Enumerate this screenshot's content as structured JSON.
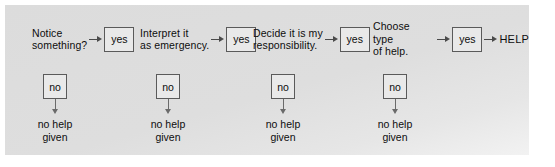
{
  "diagram": {
    "background_color": "#dedede",
    "box_border_color": "#5a5a5a",
    "arrow_color": "#4a4a4a",
    "text_color": "#0d0d0d",
    "yes_label": "yes",
    "no_label": "no",
    "outcome_no_help": "no help\ngiven",
    "terminal_label": "HELP",
    "stages": [
      {
        "id": "notice",
        "label": "Notice\nsomething?",
        "yes_label": "yes",
        "no_label": "no",
        "no_outcome": "no help\ngiven"
      },
      {
        "id": "interpret",
        "label": "Interpret it\nas emergency.",
        "yes_label": "yes",
        "no_label": "no",
        "no_outcome": "no help\ngiven"
      },
      {
        "id": "responsibility",
        "label": "Decide it is my\nresponsibility.",
        "yes_label": "yes",
        "no_label": "no",
        "no_outcome": "no help\ngiven"
      },
      {
        "id": "choose-help",
        "label": "Choose type\nof help.",
        "yes_label": "yes",
        "no_label": "no",
        "no_outcome": "no help\ngiven"
      }
    ]
  }
}
